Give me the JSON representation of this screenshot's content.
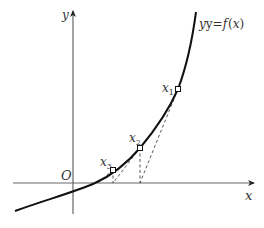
{
  "diagram": {
    "axes": {
      "x_label": "x",
      "y_label": "y",
      "origin_label": "O"
    },
    "curve": {
      "label_prefix": "y=",
      "label_func": "f",
      "label_arg_open": "(",
      "label_arg": "x",
      "label_arg_close": ")"
    },
    "points": [
      {
        "name": "x",
        "sub": "1"
      },
      {
        "name": "x",
        "sub": "2"
      },
      {
        "name": "x",
        "sub": "3"
      }
    ],
    "colors": {
      "curve": "#111111",
      "axis": "#555555",
      "dashed": "#444444",
      "text": "#333333"
    }
  }
}
